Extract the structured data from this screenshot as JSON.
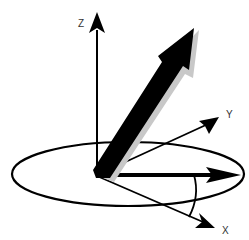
{
  "diagram": {
    "axes": {
      "z_label": "Z",
      "y_label": "Y",
      "x_label": "X"
    },
    "colors": {
      "stroke": "#000000",
      "shadow": "#c8c8c8",
      "label": "#333333",
      "background": "#ffffff"
    },
    "elements": [
      "z-axis",
      "y-axis",
      "x-axis",
      "horizontal-plane-ellipse",
      "main-vector",
      "projection-vector",
      "azimuth-angle-arc"
    ]
  }
}
